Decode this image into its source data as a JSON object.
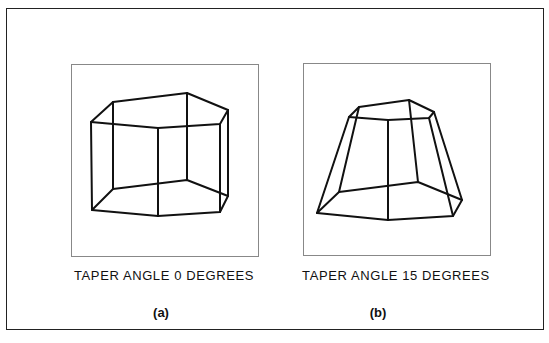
{
  "figures": [
    {
      "id": "a",
      "caption": "TAPER ANGLE 0 DEGREES",
      "label": "(a)",
      "taper_angle_degrees": 0,
      "shape": "pentagonal prism wireframe"
    },
    {
      "id": "b",
      "caption": "TAPER ANGLE 15 DEGREES",
      "label": "(b)",
      "taper_angle_degrees": 15,
      "shape": "tapered pentagonal frustum wireframe"
    }
  ],
  "colors": {
    "line": "#111111",
    "panel_border": "#888888",
    "frame_border": "#222222",
    "background": "#ffffff"
  }
}
